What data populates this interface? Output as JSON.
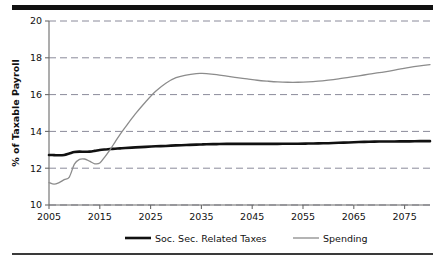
{
  "chart_data": {
    "type": "line",
    "title": "",
    "xlabel": "",
    "ylabel": "% of Taxable Payroll",
    "xlim": [
      2005,
      2080
    ],
    "ylim": [
      10,
      20
    ],
    "grid": true,
    "grid_style": "dashed-horizontal",
    "legend_position": "bottom",
    "xticks": [
      "2005",
      "2015",
      "2025",
      "2035",
      "2045",
      "2055",
      "2065",
      "2075"
    ],
    "xtick_values": [
      2005,
      2015,
      2025,
      2035,
      2045,
      2055,
      2065,
      2075
    ],
    "yticks": [
      "10",
      "12",
      "14",
      "16",
      "18",
      "20"
    ],
    "ytick_values": [
      10,
      12,
      14,
      16,
      18,
      20
    ],
    "x": [
      2005,
      2006,
      2007,
      2008,
      2009,
      2010,
      2011,
      2012,
      2013,
      2014,
      2015,
      2016,
      2017,
      2018,
      2019,
      2020,
      2022,
      2024,
      2026,
      2028,
      2030,
      2032,
      2034,
      2035,
      2036,
      2038,
      2040,
      2042,
      2044,
      2046,
      2048,
      2050,
      2052,
      2054,
      2056,
      2058,
      2060,
      2062,
      2064,
      2066,
      2068,
      2070,
      2072,
      2074,
      2076,
      2078,
      2080
    ],
    "series": [
      {
        "name": "Soc. Sec. Related Taxes",
        "color": "#111111",
        "width": 2.6,
        "values": [
          12.72,
          12.71,
          12.7,
          12.72,
          12.8,
          12.88,
          12.9,
          12.89,
          12.9,
          12.94,
          12.99,
          13.02,
          13.04,
          13.06,
          13.08,
          13.1,
          13.13,
          13.16,
          13.19,
          13.21,
          13.24,
          13.26,
          13.28,
          13.29,
          13.3,
          13.31,
          13.32,
          13.32,
          13.32,
          13.32,
          13.32,
          13.32,
          13.33,
          13.33,
          13.34,
          13.35,
          13.36,
          13.38,
          13.4,
          13.42,
          13.44,
          13.45,
          13.45,
          13.46,
          13.46,
          13.47,
          13.47
        ]
      },
      {
        "name": "Spending",
        "color": "#8c8c8c",
        "width": 1.3,
        "values": [
          11.22,
          11.13,
          11.22,
          11.38,
          11.52,
          12.22,
          12.48,
          12.5,
          12.38,
          12.24,
          12.28,
          12.62,
          13.0,
          13.42,
          13.84,
          14.22,
          14.95,
          15.6,
          16.18,
          16.62,
          16.92,
          17.06,
          17.14,
          17.15,
          17.14,
          17.08,
          17.0,
          16.92,
          16.85,
          16.78,
          16.73,
          16.69,
          16.67,
          16.67,
          16.69,
          16.73,
          16.79,
          16.86,
          16.94,
          17.02,
          17.11,
          17.19,
          17.28,
          17.38,
          17.48,
          17.56,
          17.63
        ]
      }
    ],
    "legend": [
      {
        "label": "Soc. Sec. Related Taxes",
        "color": "#111111",
        "width": 2.6
      },
      {
        "label": "Spending",
        "color": "#8c8c8c",
        "width": 1.3
      }
    ]
  },
  "colors": {
    "taxes_line": "#111111",
    "spending_line": "#8c8c8c",
    "grid": "#8a8a9a",
    "axis": "#6a6a6a",
    "rule": "#111111",
    "background": "#ffffff"
  }
}
